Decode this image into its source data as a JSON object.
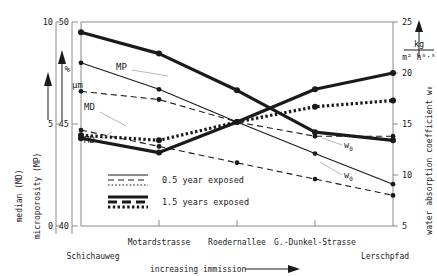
{
  "chart_data": {
    "type": "line",
    "title": "",
    "xlabel": "increasing immission",
    "categories": [
      "Schichauweg",
      "Motardstrasse",
      "Roedernallee",
      "G.-Dunkel-Strasse",
      "Lerschpfad"
    ],
    "grid": false,
    "legend_position": "inside-lower-left",
    "axes": [
      {
        "id": "md",
        "name": "median (MD)",
        "unit": "µm",
        "ticks": [
          "10",
          "5",
          "0"
        ],
        "tickvals": [
          10,
          5,
          0
        ],
        "ylim": [
          0,
          10
        ],
        "side": "left"
      },
      {
        "id": "mp",
        "name": "microporosity (MP)",
        "unit": "%",
        "ticks": [
          "50",
          "45",
          "40"
        ],
        "tickvals": [
          50,
          45,
          40
        ],
        "ylim": [
          40,
          50
        ],
        "side": "left"
      },
      {
        "id": "w0",
        "name": "water absorption coefficient w₀",
        "unit_num": "kg",
        "unit_den": "m² h⁰·⁵",
        "ticks": [
          "25",
          "20",
          "15",
          "10",
          "5"
        ],
        "tickvals": [
          25,
          20,
          15,
          10,
          5
        ],
        "ylim": [
          5,
          25
        ],
        "side": "right"
      }
    ],
    "legend": [
      {
        "label": "0.5 year exposed",
        "weight": "thin"
      },
      {
        "label": "1.5 years exposed",
        "weight": "thick"
      }
    ],
    "annotations": [
      {
        "text": "MP",
        "series": "mp-05"
      },
      {
        "text": "MD",
        "series": "md-05"
      },
      {
        "text": "MD",
        "series": "md-15"
      },
      {
        "text": "w₀",
        "series": "w0-05"
      },
      {
        "text": "w₀",
        "series": "w0-15"
      }
    ],
    "series": [
      {
        "name": "MD 0.5 year exposed",
        "key": "md-05",
        "axis": "md",
        "style": "dashed",
        "weight": "thin",
        "values": [
          4.7,
          3.9,
          3.1,
          2.3,
          1.5
        ]
      },
      {
        "name": "MD 1.5 years exposed",
        "key": "md-15",
        "axis": "md",
        "style": "dotted",
        "weight": "thick",
        "values": [
          4.45,
          4.2,
          5.1,
          5.85,
          6.15
        ]
      },
      {
        "name": "MP 0.5 year exposed",
        "key": "mp-05",
        "axis": "mp",
        "style": "dashed",
        "weight": "thin",
        "values": [
          46.6,
          46.2,
          45.1,
          44.4,
          44.4
        ]
      },
      {
        "name": "MP 1.5 years exposed",
        "key": "mp-15",
        "axis": "mp",
        "style": "solid",
        "weight": "thick",
        "values": [
          44.3,
          43.6,
          45.1,
          46.7,
          47.5
        ]
      },
      {
        "name": "w₀ 0.5 year exposed",
        "key": "w0-05",
        "axis": "w0",
        "style": "solid",
        "weight": "thin",
        "values": [
          21.0,
          18.4,
          15.2,
          12.1,
          9.1
        ]
      },
      {
        "name": "w₀ 1.5 years exposed",
        "key": "w0-15",
        "axis": "w0",
        "style": "solid",
        "weight": "thick",
        "values": [
          24.0,
          21.9,
          18.3,
          14.2,
          13.4
        ]
      }
    ]
  }
}
